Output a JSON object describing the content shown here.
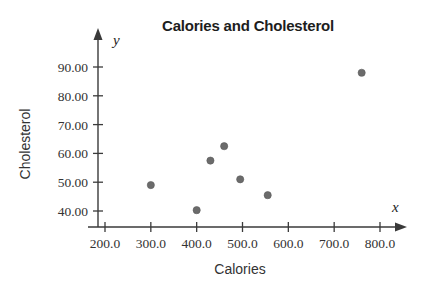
{
  "chart_data": {
    "type": "scatter",
    "title": "Calories and Cholesterol",
    "xlabel": "Calories",
    "ylabel": "Cholesterol",
    "x_axis_variable": "x",
    "y_axis_variable": "y",
    "xlim": [
      170,
      830
    ],
    "ylim": [
      33,
      96
    ],
    "grid": false,
    "legend": false,
    "x_ticks": [
      200,
      300,
      400,
      500,
      600,
      700,
      800
    ],
    "x_tick_labels": [
      "200.0",
      "300.0",
      "400.0",
      "500.0",
      "600.0",
      "700.0",
      "800.0"
    ],
    "y_ticks": [
      40,
      50,
      60,
      70,
      80,
      90
    ],
    "y_tick_labels": [
      "40.00",
      "50.00",
      "60.00",
      "70.00",
      "80.00",
      "90.00"
    ],
    "point_color": "#6b6b6b",
    "axis_color": "#3a3a3a",
    "background_color": "#ffffff",
    "points": [
      {
        "x": 300,
        "y": 49.0
      },
      {
        "x": 400,
        "y": 40.3
      },
      {
        "x": 430,
        "y": 57.5
      },
      {
        "x": 460,
        "y": 62.5
      },
      {
        "x": 495,
        "y": 51.0
      },
      {
        "x": 555,
        "y": 45.5
      },
      {
        "x": 760,
        "y": 88.0
      }
    ]
  }
}
